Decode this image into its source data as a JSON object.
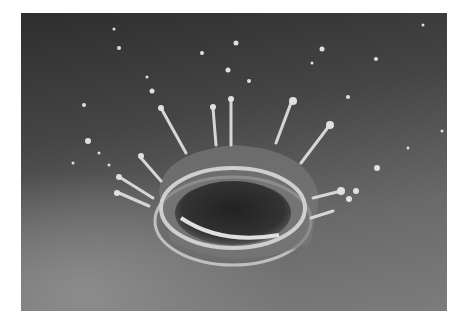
{
  "image": {
    "subject": "milk drop crown splash",
    "description": "Black-and-white photograph of a liquid drop impact forming a crown with droplets on a gray surface",
    "colors": {
      "background": "#ffffff",
      "dark": "#2e2e2e",
      "light": "#8c8c8c",
      "liquid": "#d8d8d8"
    }
  }
}
